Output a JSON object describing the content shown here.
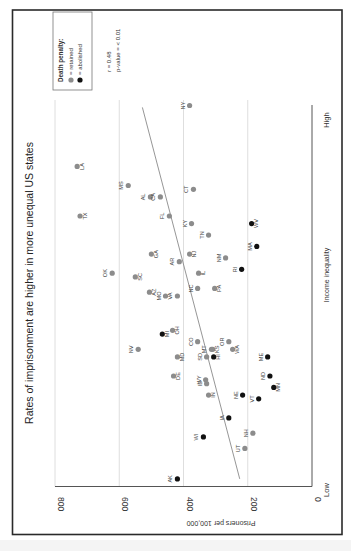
{
  "chart_data": {
    "type": "scatter",
    "orientation": "rotated 90° counter-clockwise (y-axis runs along bottom edge, x-axis runs up the right edge)",
    "title": "Rates of imprisonment are higher in more unequal US states",
    "xlabel": "Income inequality",
    "x_tick_labels": {
      "low": "Low",
      "high": "High"
    },
    "x_scale": "relative index 0 (Low) to 1 (High); no numeric ticks shown",
    "ylabel": "Prisoners per 100,000",
    "ylim": [
      0,
      800
    ],
    "y_ticks": [
      0,
      200,
      400,
      600,
      800
    ],
    "grid": true,
    "legend": {
      "title": "Death penalty:",
      "entries": [
        {
          "label": "= retained",
          "color": "#8c8c8c"
        },
        {
          "label": "= abolished",
          "color": "#111111"
        }
      ]
    },
    "annotations": [
      "r = 0.48",
      "p-value = < 0.01"
    ],
    "regression_line": {
      "from": {
        "x": 0.995,
        "y": 528
      },
      "to": {
        "x": 0.02,
        "y": 225
      }
    },
    "points": [
      {
        "state": "NY",
        "x": 1.0,
        "y": 381,
        "death_penalty": "retained",
        "label_side": "left"
      },
      {
        "state": "LA",
        "x": 0.84,
        "y": 731,
        "death_penalty": "retained",
        "label_side": "right"
      },
      {
        "state": "MS",
        "x": 0.79,
        "y": 572,
        "death_penalty": "retained",
        "label_side": "left"
      },
      {
        "state": "AL",
        "x": 0.76,
        "y": 503,
        "death_penalty": "retained",
        "label_side": "left"
      },
      {
        "state": "CA",
        "x": 0.76,
        "y": 472,
        "death_penalty": "retained",
        "label_side": "left"
      },
      {
        "state": "CT",
        "x": 0.78,
        "y": 369,
        "death_penalty": "retained",
        "label_side": "left"
      },
      {
        "state": "TX",
        "x": 0.71,
        "y": 722,
        "death_penalty": "retained",
        "label_side": "right"
      },
      {
        "state": "FL",
        "x": 0.71,
        "y": 444,
        "death_penalty": "retained",
        "label_side": "left"
      },
      {
        "state": "KY",
        "x": 0.69,
        "y": 375,
        "death_penalty": "retained",
        "label_side": "left"
      },
      {
        "state": "WV",
        "x": 0.69,
        "y": 188,
        "death_penalty": "abolished",
        "label_side": "right"
      },
      {
        "state": "TN",
        "x": 0.66,
        "y": 322,
        "death_penalty": "retained",
        "label_side": "left"
      },
      {
        "state": "MA",
        "x": 0.63,
        "y": 172,
        "death_penalty": "abolished",
        "label_side": "left"
      },
      {
        "state": "GA",
        "x": 0.61,
        "y": 500,
        "death_penalty": "retained",
        "label_side": "right"
      },
      {
        "state": "NJ",
        "x": 0.61,
        "y": 381,
        "death_penalty": "retained",
        "label_side": "right"
      },
      {
        "state": "NM",
        "x": 0.6,
        "y": 269,
        "death_penalty": "retained",
        "label_side": "left"
      },
      {
        "state": "AR",
        "x": 0.59,
        "y": 413,
        "death_penalty": "retained",
        "label_side": "left"
      },
      {
        "state": "RI",
        "x": 0.57,
        "y": 219,
        "death_penalty": "abolished",
        "label_side": "left"
      },
      {
        "state": "IL",
        "x": 0.56,
        "y": 353,
        "death_penalty": "retained",
        "label_side": "right"
      },
      {
        "state": "OK",
        "x": 0.56,
        "y": 622,
        "death_penalty": "retained",
        "label_side": "left"
      },
      {
        "state": "SC",
        "x": 0.55,
        "y": 550,
        "death_penalty": "retained",
        "label_side": "right"
      },
      {
        "state": "NC",
        "x": 0.52,
        "y": 356,
        "death_penalty": "retained",
        "label_side": "left"
      },
      {
        "state": "PA",
        "x": 0.52,
        "y": 303,
        "death_penalty": "retained",
        "label_side": "right"
      },
      {
        "state": "AZ",
        "x": 0.51,
        "y": 506,
        "death_penalty": "retained",
        "label_side": "right"
      },
      {
        "state": "MO",
        "x": 0.5,
        "y": 456,
        "death_penalty": "retained",
        "label_side": "left"
      },
      {
        "state": "VA",
        "x": 0.5,
        "y": 419,
        "death_penalty": "retained",
        "label_side": "left"
      },
      {
        "state": "OH",
        "x": 0.41,
        "y": 434,
        "death_penalty": "retained",
        "label_side": "right"
      },
      {
        "state": "MI",
        "x": 0.4,
        "y": 466,
        "death_penalty": "abolished",
        "label_side": "right"
      },
      {
        "state": "CO",
        "x": 0.38,
        "y": 356,
        "death_penalty": "retained",
        "label_side": "left"
      },
      {
        "state": "OR",
        "x": 0.38,
        "y": 259,
        "death_penalty": "retained",
        "label_side": "left"
      },
      {
        "state": "NV",
        "x": 0.36,
        "y": 541,
        "death_penalty": "retained",
        "label_side": "left"
      },
      {
        "state": "MT",
        "x": 0.36,
        "y": 313,
        "death_penalty": "retained",
        "label_side": "left"
      },
      {
        "state": "WA",
        "x": 0.36,
        "y": 247,
        "death_penalty": "retained",
        "label_side": "right"
      },
      {
        "state": "KS",
        "x": 0.36,
        "y": 309,
        "death_penalty": "retained",
        "label_side": "right"
      },
      {
        "state": "MD",
        "x": 0.34,
        "y": 419,
        "death_penalty": "retained",
        "label_side": "right"
      },
      {
        "state": "SD",
        "x": 0.34,
        "y": 328,
        "death_penalty": "retained",
        "label_side": "left"
      },
      {
        "state": "HI",
        "x": 0.34,
        "y": 306,
        "death_penalty": "abolished",
        "label_side": "right"
      },
      {
        "state": "ME",
        "x": 0.34,
        "y": 138,
        "death_penalty": "abolished",
        "label_side": "left"
      },
      {
        "state": "DE",
        "x": 0.29,
        "y": 431,
        "death_penalty": "retained",
        "label_side": "right"
      },
      {
        "state": "ND",
        "x": 0.29,
        "y": 131,
        "death_penalty": "abolished",
        "label_side": "left"
      },
      {
        "state": "WY",
        "x": 0.28,
        "y": 331,
        "death_penalty": "retained",
        "label_side": "left"
      },
      {
        "state": "ID",
        "x": 0.27,
        "y": 328,
        "death_penalty": "retained",
        "label_side": "left"
      },
      {
        "state": "MN",
        "x": 0.26,
        "y": 119,
        "death_penalty": "abolished",
        "label_side": "right"
      },
      {
        "state": "IN",
        "x": 0.24,
        "y": 322,
        "death_penalty": "retained",
        "label_side": "right"
      },
      {
        "state": "NE",
        "x": 0.24,
        "y": 216,
        "death_penalty": "abolished",
        "label_side": "left"
      },
      {
        "state": "VT",
        "x": 0.23,
        "y": 166,
        "death_penalty": "abolished",
        "label_side": "left"
      },
      {
        "state": "IA",
        "x": 0.18,
        "y": 259,
        "death_penalty": "abolished",
        "label_side": "left"
      },
      {
        "state": "NH",
        "x": 0.14,
        "y": 184,
        "death_penalty": "retained",
        "label_side": "left"
      },
      {
        "state": "WI",
        "x": 0.13,
        "y": 338,
        "death_penalty": "abolished",
        "label_side": "left"
      },
      {
        "state": "UT",
        "x": 0.1,
        "y": 209,
        "death_penalty": "retained",
        "label_side": "left"
      },
      {
        "state": "AK",
        "x": 0.02,
        "y": 419,
        "death_penalty": "abolished",
        "label_side": "left"
      }
    ]
  },
  "colors": {
    "retained": "#8c8c8c",
    "abolished": "#111111",
    "frame": "#2a2a2a",
    "grid": "#d6d6d6",
    "regression": "#8a8a8a"
  },
  "labels": {
    "title": "Rates of imprisonment are higher in more unequal US states",
    "legend_title": "Death penalty:",
    "legend_retained": "= retained",
    "legend_abolished": "= abolished",
    "stat_r": "r = 0.48",
    "stat_p": "p-value = < 0.01",
    "y_axis_label": "Prisoners per 100,000",
    "x_axis_label": "Income inequality",
    "x_low": "Low",
    "x_high": "High"
  }
}
